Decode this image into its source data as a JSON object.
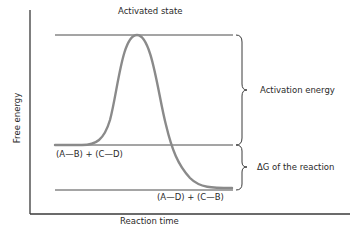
{
  "diagram": {
    "type": "free-energy-reaction-diagram",
    "axes": {
      "x_label": "Reaction time",
      "y_label": "Free energy"
    },
    "levels": {
      "activated_state": {
        "label": "Activated state"
      },
      "reactants": {
        "label": "(A—B) + (C—D)"
      },
      "products": {
        "label": "(A—D) + (C—B)"
      }
    },
    "braces": {
      "activation_energy": {
        "label": "Activation energy"
      },
      "delta_g": {
        "label": "ΔG of the reaction"
      }
    },
    "colors": {
      "curve": "#8a8a8a",
      "lines": "#3a3a3a",
      "text": "#2a2a2a"
    }
  }
}
